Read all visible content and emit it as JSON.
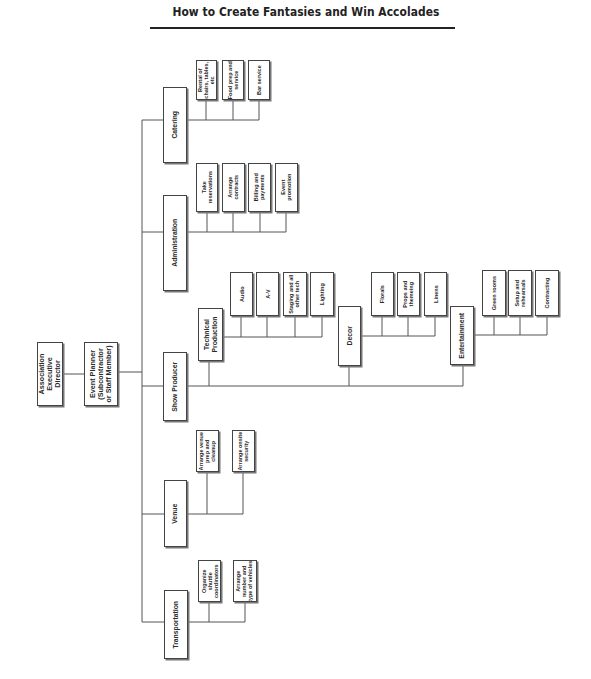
{
  "title": "How to Create Fantasies and Win Accolades",
  "org_chart": {
    "root": {
      "label": "Association\nExecutive\nDirector"
    },
    "planner": {
      "label": "Event Planner\n(Subcontractor\nor Staff Member)"
    },
    "departments": {
      "catering": {
        "label": "Catering",
        "children": [
          "Rental of\nchairs, tables,\netc",
          "Food prep and\nservice",
          "Bar service"
        ]
      },
      "administration": {
        "label": "Administration",
        "children": [
          "Take\nreservations",
          "Arrange\ncontracts",
          "Billing and\npayments",
          "Event\npromotion"
        ]
      },
      "show_producer": {
        "label": "Show Producer",
        "technical": {
          "label": "Technical\nProduction",
          "children": [
            "Audio",
            "A-V",
            "Staging and all\nother tech",
            "Lighting"
          ]
        },
        "decor": {
          "label": "Decor",
          "children": [
            "Florals",
            "Props and\nthemeing",
            "Linens"
          ]
        },
        "entertainment": {
          "label": "Entertainment",
          "children": [
            "Green rooms",
            "Setup and\nrehearsals",
            "Contracting"
          ]
        }
      },
      "venue": {
        "label": "Venue",
        "children": [
          "Arrange venue\nprep and\ncleanup",
          "Arrange onsite\nsecurity"
        ]
      },
      "transportation": {
        "label": "Transportation",
        "children": [
          "Organize\nshuttle\ncoordinators",
          "Arrange\nnumber and\ntype of vehicles"
        ]
      }
    }
  }
}
